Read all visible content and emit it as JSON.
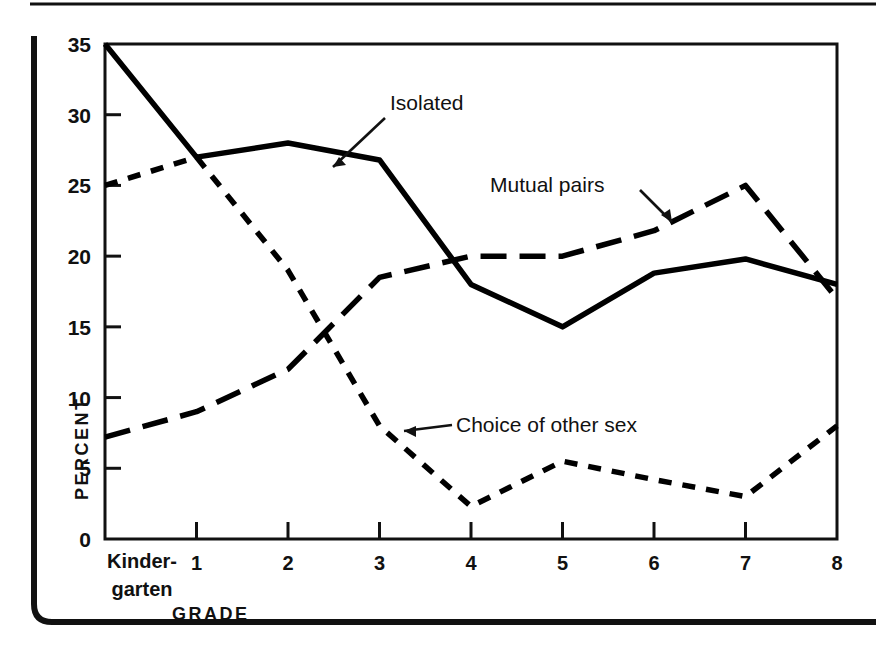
{
  "chart_data": {
    "type": "line",
    "title": "",
    "xlabel": "GRADE",
    "ylabel": "PERCENT",
    "categories": [
      "Kinder-garten",
      "1",
      "2",
      "3",
      "4",
      "5",
      "6",
      "7",
      "8"
    ],
    "x": [
      0,
      1,
      2,
      3,
      4,
      5,
      6,
      7,
      8
    ],
    "xlim": [
      0,
      8
    ],
    "ylim": [
      0,
      35
    ],
    "yticks": [
      0,
      5,
      10,
      15,
      20,
      25,
      30,
      35
    ],
    "xticks": [
      0,
      1,
      2,
      3,
      4,
      5,
      6,
      7,
      8
    ],
    "grid": false,
    "legend": "inline-annotations",
    "series": [
      {
        "name": "Isolated",
        "style": "solid",
        "color": "#000000",
        "values": [
          35,
          27,
          28,
          26.8,
          18,
          15,
          18.8,
          19.8,
          18
        ]
      },
      {
        "name": "Mutual pairs",
        "style": "long-dash",
        "color": "#000000",
        "values": [
          7.2,
          9,
          12,
          18.5,
          20,
          20,
          21.8,
          25,
          17
        ]
      },
      {
        "name": "Choice of other sex",
        "style": "short-dash",
        "color": "#000000",
        "values": [
          25,
          27,
          19,
          8,
          2.3,
          5.5,
          4.2,
          3,
          8
        ]
      }
    ],
    "annotations": [
      {
        "text": "Isolated",
        "label_x": 390,
        "label_y": 110,
        "arrow_to_x": 330,
        "arrow_to_y": 164
      },
      {
        "text": "Mutual pairs",
        "label_x": 490,
        "label_y": 185,
        "arrow_to_x": 666,
        "arrow_to_y": 221
      },
      {
        "text": "Choice of other sex",
        "label_x": 456,
        "label_y": 424,
        "arrow_to_x": 404,
        "arrow_to_y": 430
      }
    ]
  },
  "axis": {
    "y_label": "PERCENT",
    "x_label": "GRADE",
    "y_ticks": [
      "0",
      "5",
      "10",
      "15",
      "20",
      "25",
      "30",
      "35"
    ],
    "x_ticks": [
      "1",
      "2",
      "3",
      "4",
      "5",
      "6",
      "7",
      "8"
    ],
    "kindergarten_line1": "Kinder-",
    "kindergarten_line2": "garten"
  },
  "series_labels": {
    "isolated": "Isolated",
    "mutual_pairs": "Mutual pairs",
    "choice_other_sex": "Choice of other sex"
  },
  "caption": {
    "text": ""
  }
}
